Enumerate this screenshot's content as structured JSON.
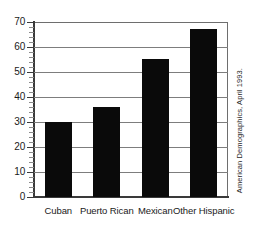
{
  "chart_data": {
    "type": "bar",
    "title": "",
    "subtitle": "",
    "xlabel": "",
    "ylabel": "",
    "categories": [
      "Cuban",
      "Puerto Rican",
      "Mexican",
      "Other Hispanic"
    ],
    "values": [
      30,
      36,
      55,
      67
    ],
    "ylim": [
      0,
      70
    ],
    "ytick_labels": [
      "0",
      "10",
      "20",
      "30",
      "40",
      "50",
      "60",
      "70"
    ],
    "ytick_values": [
      0,
      10,
      20,
      30,
      40,
      50,
      60,
      70
    ],
    "ytick_minor_step": 2,
    "grid": true,
    "grid_orientation": "horizontal",
    "legend": "none",
    "bar_color": "#0a0a0a",
    "grid_color": "#7d7d7d",
    "axis_color": "#3a3a3a",
    "background_color": "#ffffff",
    "annotations": [
      "American Demographics, April 1993."
    ]
  },
  "source": {
    "credit": "American Demographics, April 1993."
  }
}
